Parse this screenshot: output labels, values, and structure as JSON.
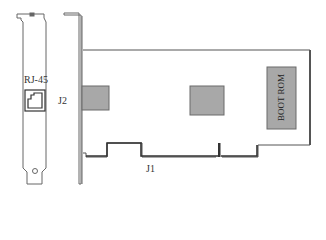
{
  "diagram": {
    "type": "network-card-layout",
    "labels": {
      "rj45": "RJ-45",
      "j2": "J2",
      "j1": "J1",
      "boot_rom": "BOOT ROM"
    },
    "colors": {
      "outline": "#555555",
      "chip_fill": "#a8a8a8",
      "chip_border": "#6a6a6a",
      "background": "#ffffff"
    }
  }
}
